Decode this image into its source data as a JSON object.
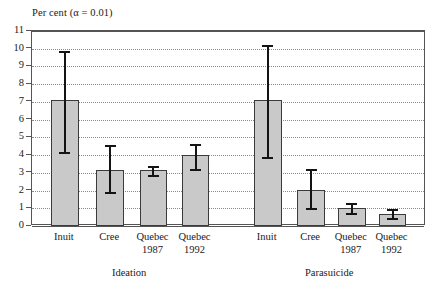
{
  "chart_data": {
    "type": "bar",
    "title": "Per cent (α = 0.01)",
    "xlabel": "",
    "ylabel": "Per cent",
    "ylim": [
      0,
      11
    ],
    "yticks": [
      0,
      1,
      2,
      3,
      4,
      5,
      6,
      7,
      8,
      9,
      10,
      11
    ],
    "ytick_labels": [
      "0",
      "1",
      "2",
      "3",
      "4",
      "5",
      "6",
      "7",
      "8",
      "9",
      "10",
      "11"
    ],
    "grid": true,
    "grid_axis": "y",
    "grid_style": "dotted",
    "legend": "none",
    "error_bars": "95% confidence interval (alpha = 0.01)",
    "groups": [
      {
        "name": "Ideation",
        "categories": [
          "Inuit",
          "Cree",
          "Quebec 1987",
          "Quebec 1992"
        ],
        "values": [
          7.1,
          3.15,
          3.15,
          4.0
        ],
        "err_low": [
          4.15,
          1.9,
          2.85,
          3.2
        ],
        "err_high": [
          9.85,
          4.55,
          3.4,
          4.6
        ]
      },
      {
        "name": "Parasuicide",
        "categories": [
          "Inuit",
          "Cree",
          "Quebec 1987",
          "Quebec 1992"
        ],
        "values": [
          7.1,
          2.05,
          1.0,
          0.7
        ],
        "err_low": [
          3.9,
          1.0,
          0.75,
          0.45
        ],
        "err_high": [
          10.2,
          3.2,
          1.3,
          0.95
        ]
      }
    ],
    "bar_fill_color": "#c9c9c9",
    "bar_edge_color": "#3b3b3b",
    "error_bar_color": "#141414",
    "axis_color": "#555555",
    "background_color": "#ffffff"
  },
  "category_labels": [
    {
      "line1": "Inuit",
      "line2": ""
    },
    {
      "line1": "Cree",
      "line2": ""
    },
    {
      "line1": "Quebec",
      "line2": "1987"
    },
    {
      "line1": "Quebec",
      "line2": "1992"
    },
    {
      "line1": "Inuit",
      "line2": ""
    },
    {
      "line1": "Cree",
      "line2": ""
    },
    {
      "line1": "Quebec",
      "line2": "1987"
    },
    {
      "line1": "Quebec",
      "line2": "1992"
    }
  ],
  "group_labels": [
    "Ideation",
    "Parasuicide"
  ]
}
